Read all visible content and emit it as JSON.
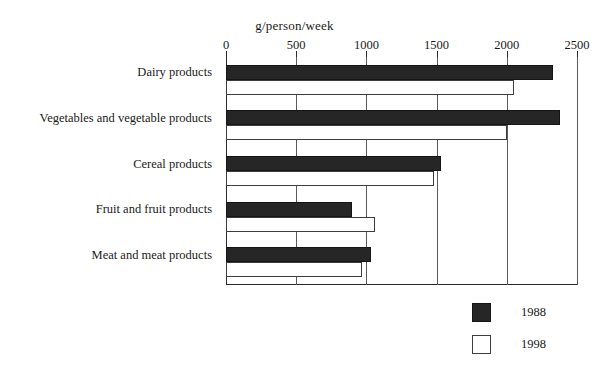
{
  "chart_data": {
    "type": "bar",
    "orientation": "horizontal",
    "title": "",
    "xlabel": "g/person/week",
    "ylabel": "",
    "xlim": [
      0,
      2500
    ],
    "xticks": [
      0,
      500,
      1000,
      1500,
      2000,
      2500
    ],
    "xtick_labels": [
      "0",
      "500",
      "1000",
      "1500",
      "2000",
      "2500"
    ],
    "grid": true,
    "grid_axis": "x",
    "legend_position": "bottom-right",
    "categories": [
      "Dairy products",
      "Vegetables and vegetable products",
      "Cereal products",
      "Fruit and fruit products",
      "Meat and meat products"
    ],
    "series": [
      {
        "name": "1988",
        "color": "#262626",
        "values": [
          2330,
          2380,
          1530,
          900,
          1030
        ]
      },
      {
        "name": "1998",
        "color": "#ffffff",
        "values": [
          2050,
          2000,
          1480,
          1060,
          970
        ]
      }
    ]
  },
  "legend": {
    "entries": [
      {
        "label": "1988",
        "swatch": "filled"
      },
      {
        "label": "1998",
        "swatch": "hollow"
      }
    ]
  }
}
